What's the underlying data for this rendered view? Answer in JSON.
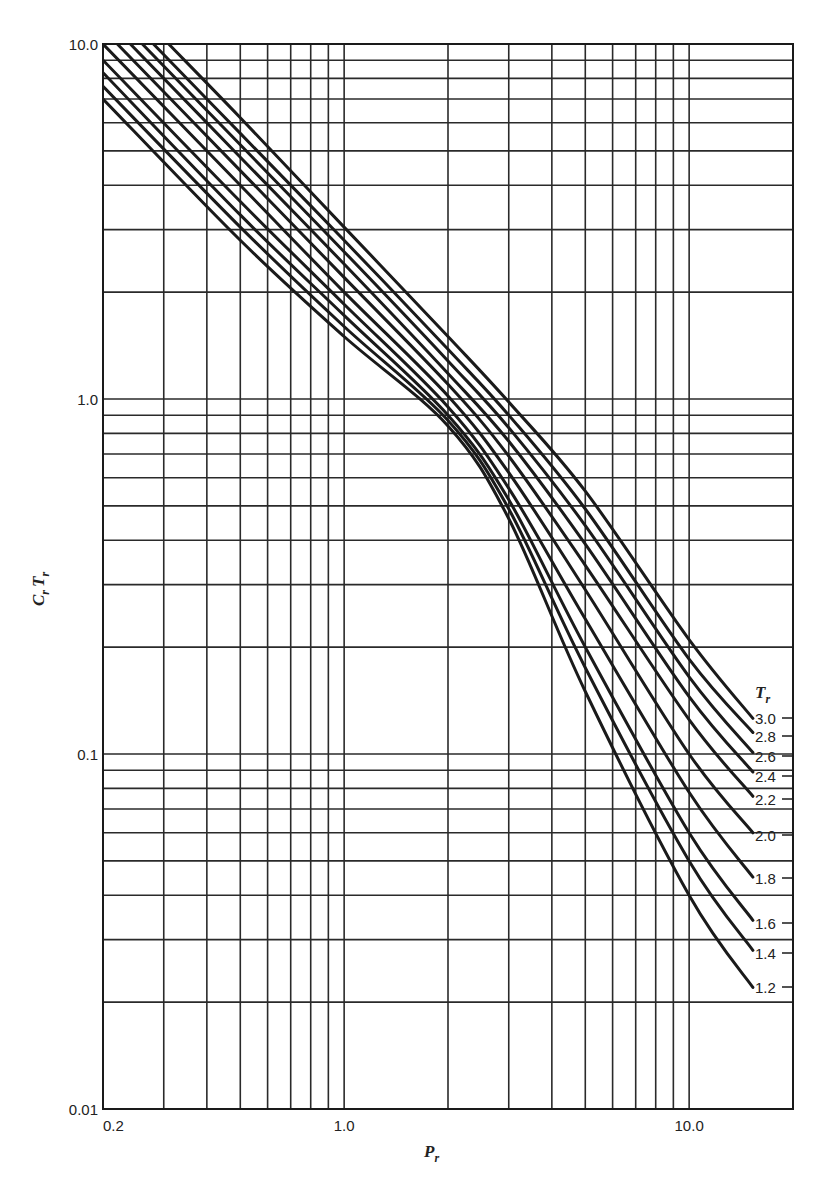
{
  "chart_data": {
    "type": "line",
    "title": "",
    "xlabel": "P_r",
    "ylabel": "C_r T_r",
    "xscale": "log",
    "yscale": "log",
    "xlim": [
      0.2,
      20
    ],
    "ylim": [
      0.01,
      10
    ],
    "grid": true,
    "x_tick_labels": [
      {
        "value": 0.2,
        "label": "0.2"
      },
      {
        "value": 1.0,
        "label": "1.0"
      },
      {
        "value": 10.0,
        "label": "10.0"
      }
    ],
    "y_tick_labels": [
      {
        "value": 10.0,
        "label": "10.0"
      },
      {
        "value": 1.0,
        "label": "1.0"
      },
      {
        "value": 0.1,
        "label": "0.1"
      },
      {
        "value": 0.01,
        "label": "0.01"
      }
    ],
    "x_gridlines": [
      0.2,
      0.3,
      0.4,
      0.5,
      0.6,
      0.7,
      0.8,
      0.9,
      1,
      2,
      3,
      4,
      5,
      6,
      7,
      8,
      9,
      10
    ],
    "y_gridlines": [
      0.01,
      0.02,
      0.03,
      0.04,
      0.05,
      0.06,
      0.07,
      0.08,
      0.09,
      0.1,
      0.2,
      0.3,
      0.4,
      0.5,
      0.6,
      0.7,
      0.8,
      0.9,
      1,
      2,
      3,
      4,
      5,
      6,
      7,
      8,
      9,
      10
    ],
    "legend_title": "T_r",
    "legend_position": "right, at curve ends",
    "series": [
      {
        "name": "3.0",
        "x": [
          0.31,
          0.5,
          1,
          2,
          3,
          5,
          10,
          15.3
        ],
        "y": [
          10,
          6.2,
          3.05,
          1.5,
          0.98,
          0.55,
          0.21,
          0.126
        ]
      },
      {
        "name": "2.8",
        "x": [
          0.28,
          0.5,
          1,
          2,
          3,
          5,
          10,
          15.3
        ],
        "y": [
          10,
          5.6,
          2.8,
          1.38,
          0.9,
          0.49,
          0.185,
          0.115
        ]
      },
      {
        "name": "2.6",
        "x": [
          0.26,
          0.5,
          1,
          2,
          3,
          5,
          10,
          15.3
        ],
        "y": [
          10,
          5.2,
          2.6,
          1.28,
          0.83,
          0.44,
          0.165,
          0.101
        ]
      },
      {
        "name": "2.4",
        "x": [
          0.24,
          0.5,
          1,
          2,
          3,
          5,
          10,
          15.3
        ],
        "y": [
          10,
          4.8,
          2.4,
          1.18,
          0.76,
          0.39,
          0.145,
          0.089
        ]
      },
      {
        "name": "2.2",
        "x": [
          0.22,
          0.5,
          1,
          2,
          3,
          5,
          10,
          15.3
        ],
        "y": [
          10,
          4.4,
          2.2,
          1.1,
          0.69,
          0.34,
          0.125,
          0.076
        ]
      },
      {
        "name": "2.0",
        "x": [
          0.2,
          0.5,
          1,
          2,
          3,
          5,
          10,
          15.3
        ],
        "y": [
          10,
          4.0,
          2.0,
          1.02,
          0.62,
          0.29,
          0.1,
          0.06
        ]
      },
      {
        "name": "1.8",
        "x": [
          0.2,
          0.5,
          1,
          2,
          3,
          5,
          10,
          15.3
        ],
        "y": [
          9.0,
          3.6,
          1.85,
          0.95,
          0.56,
          0.24,
          0.078,
          0.045
        ]
      },
      {
        "name": "1.6",
        "x": [
          0.2,
          0.5,
          1,
          2,
          3,
          5,
          10,
          15.3
        ],
        "y": [
          8.3,
          3.3,
          1.72,
          0.9,
          0.52,
          0.2,
          0.06,
          0.034
        ]
      },
      {
        "name": "1.4",
        "x": [
          0.2,
          0.5,
          1,
          2,
          3,
          5,
          10,
          15.3
        ],
        "y": [
          7.6,
          3.05,
          1.6,
          0.87,
          0.49,
          0.175,
          0.05,
          0.028
        ]
      },
      {
        "name": "1.2",
        "x": [
          0.2,
          0.5,
          1,
          2,
          3,
          5,
          10,
          15.3
        ],
        "y": [
          7.0,
          2.8,
          1.5,
          0.84,
          0.46,
          0.15,
          0.04,
          0.022
        ]
      }
    ]
  },
  "labels": {
    "x_axis_title": "P",
    "x_axis_sub": "r",
    "y_axis_title_c": "C",
    "y_axis_title_t": "T",
    "y_axis_sub": "r",
    "legend_title": "T",
    "legend_sub": "r"
  },
  "curve_label_y": {
    "3.0": 718,
    "2.8": 736,
    "2.6": 756,
    "2.4": 776,
    "2.2": 799,
    "2.0": 835,
    "1.8": 878,
    "1.6": 923,
    "1.4": 953,
    "1.2": 987
  },
  "style": {
    "line_color": "#1a1a1a",
    "grid_color": "#2a2a2a",
    "background": "#ffffff"
  }
}
